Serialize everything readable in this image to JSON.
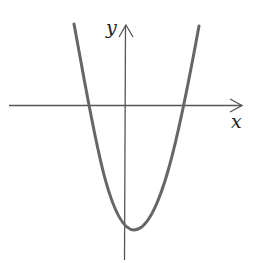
{
  "figure": {
    "type": "parabola-graph",
    "x_axis_label": "x",
    "y_axis_label": "y",
    "colors": {
      "curve": "#666666",
      "axes": "#555555",
      "labels": "#222222",
      "background": "#ffffff"
    },
    "features": {
      "opens": "up",
      "vertex_quadrant": "IV (just right of y-axis, below x-axis)",
      "roots": [
        "negative",
        "positive"
      ],
      "y_intercept": "negative"
    }
  }
}
